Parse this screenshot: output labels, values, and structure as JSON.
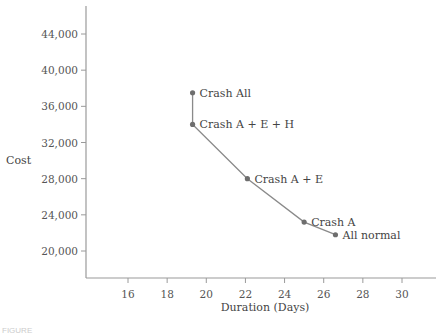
{
  "chart_data": {
    "type": "line",
    "title": "",
    "xlabel": "Duration (Days)",
    "ylabel": "Cost",
    "xlim": [
      14,
      31.5
    ],
    "ylim": [
      16000,
      47000
    ],
    "x_ticks": [
      16,
      18,
      20,
      22,
      24,
      26,
      28,
      30
    ],
    "y_ticks": [
      20000,
      24000,
      28000,
      32000,
      36000,
      40000,
      44000
    ],
    "y_tick_labels": [
      "20,000",
      "24,000",
      "28,000",
      "32,000",
      "36,000",
      "40,000",
      "44,000"
    ],
    "grid": false,
    "legend": null,
    "series": [
      {
        "name": "Time-cost trade-off",
        "points": [
          {
            "label": "Crash All",
            "x": 19.3,
            "y": 37500
          },
          {
            "label": "Crash A + E + H",
            "x": 19.3,
            "y": 34000
          },
          {
            "label": "Crash A + E",
            "x": 22.1,
            "y": 28000
          },
          {
            "label": "Crash A",
            "x": 25.0,
            "y": 23200
          },
          {
            "label": "All normal",
            "x": 26.6,
            "y": 21800
          }
        ]
      }
    ]
  },
  "colors": {
    "line": "#8a8a8a",
    "point": "#6e6e6e",
    "axis": "#9a9a9a",
    "text": "#555555"
  },
  "caption": "FIGURE"
}
